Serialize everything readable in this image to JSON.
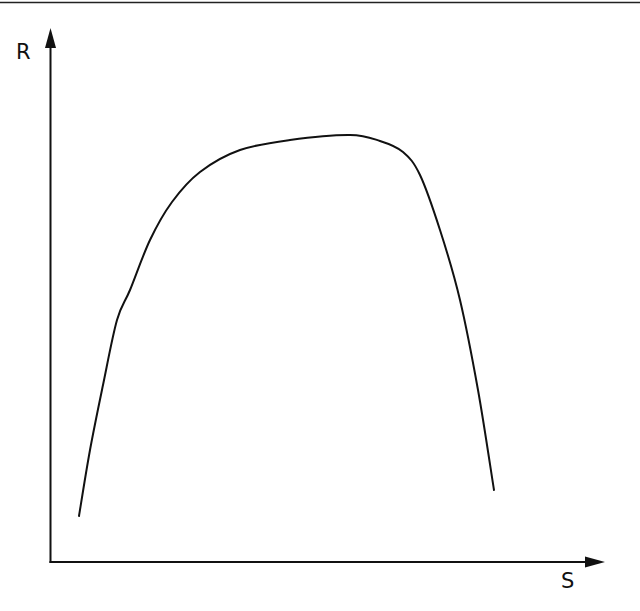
{
  "chart_data": {
    "type": "line",
    "title": "",
    "xlabel": "S",
    "ylabel": "R",
    "grid": false,
    "legend": null,
    "ticks": false,
    "series": [
      {
        "name": "R(S)",
        "pixel_points": [
          [
            79,
            516
          ],
          [
            90,
            450
          ],
          [
            103,
            385
          ],
          [
            117,
            320
          ],
          [
            130,
            290
          ],
          [
            150,
            240
          ],
          [
            172,
            202
          ],
          [
            200,
            172
          ],
          [
            240,
            150
          ],
          [
            290,
            140
          ],
          [
            350,
            135
          ],
          [
            380,
            141
          ],
          [
            403,
            152
          ],
          [
            420,
            175
          ],
          [
            440,
            230
          ],
          [
            460,
            300
          ],
          [
            478,
            390
          ],
          [
            494,
            490
          ]
        ],
        "normalized_points": [
          [
            0.05,
            0.09
          ],
          [
            0.07,
            0.21
          ],
          [
            0.1,
            0.33
          ],
          [
            0.12,
            0.45
          ],
          [
            0.14,
            0.51
          ],
          [
            0.18,
            0.6
          ],
          [
            0.22,
            0.67
          ],
          [
            0.27,
            0.73
          ],
          [
            0.34,
            0.77
          ],
          [
            0.43,
            0.79
          ],
          [
            0.54,
            0.8
          ],
          [
            0.6,
            0.79
          ],
          [
            0.64,
            0.77
          ],
          [
            0.67,
            0.72
          ],
          [
            0.71,
            0.62
          ],
          [
            0.75,
            0.49
          ],
          [
            0.78,
            0.32
          ],
          [
            0.81,
            0.13
          ]
        ]
      }
    ],
    "axes": {
      "origin_px": [
        51,
        562
      ],
      "x_axis_end_px": [
        604,
        562
      ],
      "y_axis_end_px": [
        50,
        29
      ]
    }
  },
  "labels": {
    "y_axis": "R",
    "x_axis": "S"
  },
  "style": {
    "line_color": "#111111",
    "background": "#ffffff"
  }
}
